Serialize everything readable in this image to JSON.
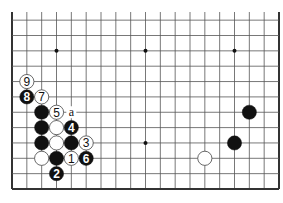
{
  "diagram": {
    "type": "go-board-partial",
    "board_size": 19,
    "visible_columns": 19,
    "visible_rows_from_bottom": 12,
    "edges": [
      "left",
      "right",
      "bottom"
    ],
    "colors": {
      "line": "#555555",
      "edge": "#333333",
      "black_stone": "#111111",
      "white_stone": "#ffffff",
      "background": "#ffffff"
    },
    "star_points": [
      {
        "col": 3,
        "row": 9
      },
      {
        "col": 9,
        "row": 9
      },
      {
        "col": 15,
        "row": 9
      },
      {
        "col": 9,
        "row": 3
      }
    ],
    "stones": [
      {
        "col": 4,
        "row": 2,
        "color": "white",
        "label": "1"
      },
      {
        "col": 3,
        "row": 1,
        "color": "black",
        "label": "2"
      },
      {
        "col": 5,
        "row": 3,
        "color": "white",
        "label": "3"
      },
      {
        "col": 4,
        "row": 4,
        "color": "black",
        "label": "4"
      },
      {
        "col": 3,
        "row": 5,
        "color": "white",
        "label": "5"
      },
      {
        "col": 5,
        "row": 2,
        "color": "black",
        "label": "6"
      },
      {
        "col": 2,
        "row": 6,
        "color": "white",
        "label": "7"
      },
      {
        "col": 1,
        "row": 6,
        "color": "black",
        "label": "8"
      },
      {
        "col": 1,
        "row": 7,
        "color": "white",
        "label": "9"
      },
      {
        "col": 2,
        "row": 5,
        "color": "black",
        "label": ""
      },
      {
        "col": 2,
        "row": 4,
        "color": "black",
        "label": ""
      },
      {
        "col": 2,
        "row": 3,
        "color": "black",
        "label": ""
      },
      {
        "col": 3,
        "row": 4,
        "color": "white",
        "label": ""
      },
      {
        "col": 3,
        "row": 3,
        "color": "white",
        "label": ""
      },
      {
        "col": 4,
        "row": 3,
        "color": "black",
        "label": ""
      },
      {
        "col": 2,
        "row": 2,
        "color": "white",
        "label": ""
      },
      {
        "col": 3,
        "row": 2,
        "color": "black",
        "label": ""
      },
      {
        "col": 16,
        "row": 5,
        "color": "black",
        "label": ""
      },
      {
        "col": 15,
        "row": 3,
        "color": "black",
        "label": ""
      },
      {
        "col": 13,
        "row": 2,
        "color": "white",
        "label": ""
      }
    ],
    "markers": [
      {
        "col": 4,
        "row": 5,
        "label": "a"
      }
    ]
  }
}
